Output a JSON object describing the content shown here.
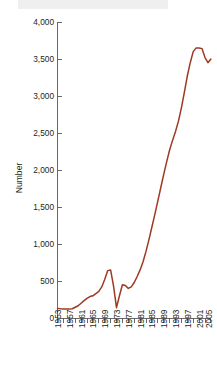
{
  "chart_data": {
    "type": "line",
    "title": "",
    "subtitle": "",
    "xlabel": "",
    "ylabel": "Number",
    "xlim": [
      1953,
      2005
    ],
    "ylim": [
      0,
      4000
    ],
    "grid": false,
    "legend": null,
    "series_color": "#9e3a22",
    "axis_color": "#58595b",
    "y_ticks": [
      0,
      500,
      1000,
      1500,
      2000,
      2500,
      3000,
      3500,
      4000
    ],
    "y_tick_labels": [
      "0",
      "500",
      "1,000",
      "1,500",
      "2,000",
      "2,500",
      "3,000",
      "3,500",
      "4,000"
    ],
    "x_tick_labels": [
      "1953",
      "1957",
      "1961",
      "1965",
      "1969",
      "1973",
      "1977",
      "1981",
      "1985",
      "1989",
      "1993",
      "1997",
      "2001",
      "2005"
    ],
    "x_tick_values": [
      1953,
      1957,
      1961,
      1965,
      1969,
      1973,
      1977,
      1981,
      1985,
      1989,
      1993,
      1997,
      2001,
      2005
    ],
    "x_minor_tick_interval": 2,
    "series": [
      {
        "name": "Number",
        "x": [
          1953,
          1954,
          1955,
          1956,
          1957,
          1958,
          1959,
          1960,
          1961,
          1962,
          1963,
          1964,
          1965,
          1966,
          1967,
          1968,
          1969,
          1970,
          1971,
          1972,
          1973,
          1974,
          1975,
          1976,
          1977,
          1978,
          1979,
          1980,
          1981,
          1982,
          1983,
          1984,
          1985,
          1986,
          1987,
          1988,
          1989,
          1990,
          1991,
          1992,
          1993,
          1994,
          1995,
          1996,
          1997,
          1998,
          1999,
          2000,
          2001,
          2002,
          2003,
          2004,
          2005
        ],
        "values": [
          130,
          125,
          122,
          120,
          120,
          125,
          145,
          165,
          200,
          235,
          265,
          290,
          300,
          330,
          360,
          420,
          520,
          640,
          650,
          430,
          140,
          300,
          450,
          440,
          400,
          420,
          480,
          560,
          650,
          760,
          900,
          1060,
          1230,
          1400,
          1580,
          1760,
          1940,
          2110,
          2270,
          2400,
          2520,
          2660,
          2840,
          3050,
          3270,
          3450,
          3600,
          3650,
          3650,
          3640,
          3520,
          3450,
          3500
        ]
      }
    ]
  }
}
